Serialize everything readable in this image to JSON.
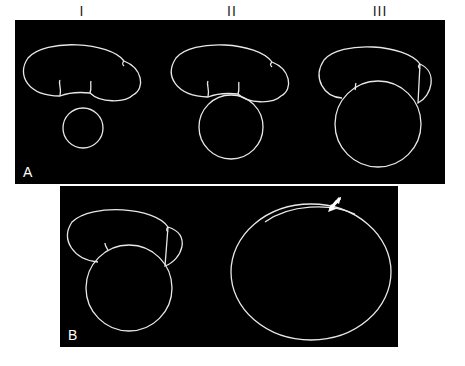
{
  "column_labels": [
    "I",
    "II",
    "III"
  ],
  "panels": [
    {
      "label": "A",
      "description": "Three stages of a round structure growing beneath a lobed structure"
    },
    {
      "label": "B",
      "description": "Round structure overlapping lobed structure and a large ellipse with arrow"
    }
  ],
  "arrow": {
    "icon": "arrow-pointer-icon",
    "color": "#ffffff"
  },
  "colors": {
    "background": "#000000",
    "lines": "#e8e8e8",
    "page": "#ffffff"
  }
}
